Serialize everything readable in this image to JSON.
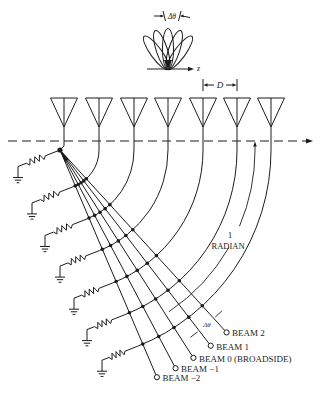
{
  "figure": {
    "top_pattern": {
      "delta_theta_label": "Δθ",
      "axis_label": "z",
      "lobe_count": 5
    },
    "antenna_array": {
      "element_count": 7,
      "spacing_label": "D"
    },
    "radian_annotation": {
      "line1": "1",
      "line2": "RADIAN"
    },
    "beam_spacing_label": "Δθ",
    "terminations": {
      "count": 7,
      "type": "resistor-to-ground"
    },
    "beams": [
      {
        "index": 2,
        "label": "BEAM 2"
      },
      {
        "index": 1,
        "label": "BEAM 1"
      },
      {
        "index": 0,
        "label": "BEAM 0 (BROADSIDE)"
      },
      {
        "index": -1,
        "label": "BEAM −1"
      },
      {
        "index": -2,
        "label": "BEAM −2"
      }
    ]
  },
  "colors": {
    "line": "#1c1c1c",
    "background": "#ffffff"
  }
}
